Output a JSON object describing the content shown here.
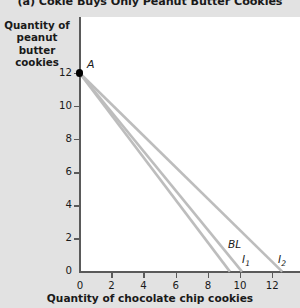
{
  "chart_data": {
    "type": "line",
    "title": "(a) Cokie Buys Only Peanut Butter Cookies",
    "xlabel": "Quantity of chocolate chip cookies",
    "ylabel": "Quantity of peanut butter cookies",
    "xlim": [
      0,
      13.7
    ],
    "ylim": [
      0,
      12.8
    ],
    "xticks": [
      "0",
      "2",
      "4",
      "6",
      "8",
      "10",
      "12"
    ],
    "yticks": [
      "0",
      "2",
      "4",
      "6",
      "8",
      "10",
      "12"
    ],
    "xtick_values": [
      0,
      2,
      4,
      6,
      8,
      10,
      12
    ],
    "ytick_values": [
      0,
      2,
      4,
      6,
      8,
      10,
      12
    ],
    "grid": false,
    "legend": "inline-labels",
    "line_color": "#bdbdbd",
    "point_color": "#000000",
    "axis_color": "#5a5a5a",
    "background": "#e2e2e2",
    "plot_background": "#ffffff",
    "series": [
      {
        "name": "BL",
        "label": "BL",
        "points": [
          [
            0,
            12
          ],
          [
            9.35,
            0
          ]
        ],
        "description": "Budget line from (0,12) to (9.35,0)"
      },
      {
        "name": "I1",
        "label": "I",
        "sub": "1",
        "points": [
          [
            0,
            12
          ],
          [
            10.1,
            0
          ]
        ],
        "description": "Indifference curve I1 from (0,12) to (10.1,0)"
      },
      {
        "name": "I2",
        "label": "I",
        "sub": "2",
        "points": [
          [
            0,
            12
          ],
          [
            12.6,
            0
          ]
        ],
        "description": "Indifference curve I2 from (0,12) to (12.6,0)"
      }
    ],
    "annotations": [
      {
        "name": "A",
        "label": "A",
        "point": [
          0,
          12
        ],
        "marker": "filled-circle",
        "description": "Optimal consumption point A at (0,12) on the vertical axis"
      }
    ]
  }
}
